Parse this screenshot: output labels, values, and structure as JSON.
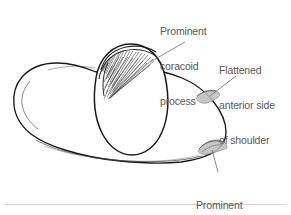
{
  "figure": {
    "background_color": "#ffffff",
    "ink_color": "#1a1a1a",
    "label_color": "#58585a",
    "rule_color": "#d6d6d6"
  },
  "callouts": {
    "coracoid": {
      "name": "prominent-coracoid-process",
      "line1": "Prominent",
      "line2": "coracoid",
      "line3": "process"
    },
    "flattened": {
      "name": "flattened-anterior-side-of-shoulder",
      "line1": "Flattened",
      "line2": "anterior side",
      "line3": "of shoulder"
    },
    "humeral": {
      "name": "prominent-humeral-head",
      "line1": "Prominent",
      "line2": "humeral head"
    }
  },
  "shapes": {
    "shoulder_outline_label": "shoulder-body-outline",
    "deltoid_oval_label": "deltoid-oval-contour",
    "coracoid_hatching_label": "coracoid-hatching",
    "humeral_head_mark_label": "humeral-head-shading",
    "anterior_flat_mark_label": "anterior-flat-shading",
    "separator_rule_label": "figure-separator-rule"
  }
}
